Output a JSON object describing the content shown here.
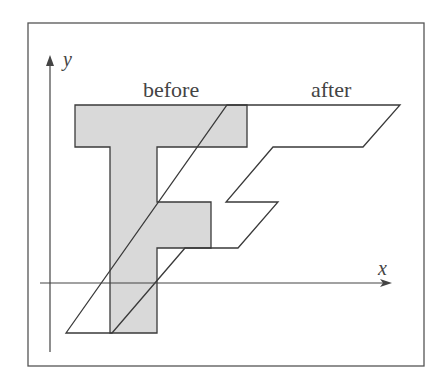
{
  "figure": {
    "labels": {
      "before": "before",
      "after": "after",
      "x_axis": "x",
      "y_axis": "y"
    },
    "colors": {
      "stroke": "#3a3a3a",
      "fill_before": "#d9d9d9",
      "frame": "#555555",
      "background": "#ffffff"
    },
    "shapes": {
      "before_F": "75,105 247,105 247,147 157,147 157,202 211,202 211,248 157,248 157,333 110,333 110,147 75,147",
      "after_F": "66,333 227,105 400,105 363,147 273,147 226,202 278,202 238,248 185,248 112,333"
    }
  }
}
